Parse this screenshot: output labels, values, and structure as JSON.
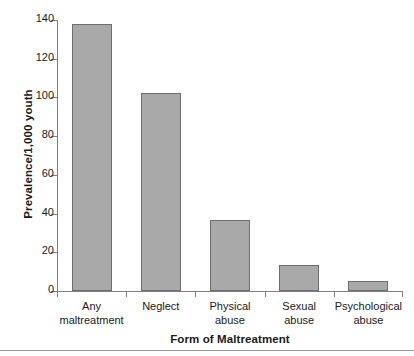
{
  "chart_data": {
    "type": "bar",
    "title": "",
    "xlabel": "Form of Maltreatment",
    "ylabel": "Prevalence/1,000 youth",
    "categories": [
      "Any maltreatment",
      "Neglect",
      "Physical abuse",
      "Sexual abuse",
      "Psychological abuse"
    ],
    "category_lines": [
      [
        "Any",
        "maltreatment"
      ],
      [
        "Neglect",
        ""
      ],
      [
        "Physical",
        "abuse"
      ],
      [
        "Sexual",
        "abuse"
      ],
      [
        "Psychological",
        "abuse"
      ]
    ],
    "values": [
      138,
      102.5,
      36.5,
      13.5,
      5
    ],
    "ylim": [
      0,
      140
    ],
    "yticks": [
      0,
      20,
      40,
      60,
      80,
      100,
      120,
      140
    ],
    "ytick_labels": [
      "0",
      "20",
      "40",
      "60",
      "80",
      "100",
      "120",
      "140"
    ],
    "grid": false,
    "legend": null,
    "bar_color": "#a9a9a9",
    "bar_edge_color": "#6e6e6e",
    "axis_color": "#808080",
    "background": "#ffffff"
  },
  "figure": {
    "bottom_rule_color": "#9a9a9a"
  }
}
